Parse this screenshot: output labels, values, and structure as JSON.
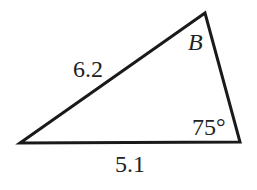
{
  "diagram": {
    "type": "triangle",
    "stroke_color": "#1a1a1a",
    "vertices": {
      "left": [
        20,
        143
      ],
      "top": [
        205,
        13
      ],
      "right": [
        240,
        142
      ]
    },
    "labels": {
      "side_left": "6.2",
      "side_bottom": "5.1",
      "vertex_top": "B",
      "vertex_right_angle": "75°"
    }
  }
}
